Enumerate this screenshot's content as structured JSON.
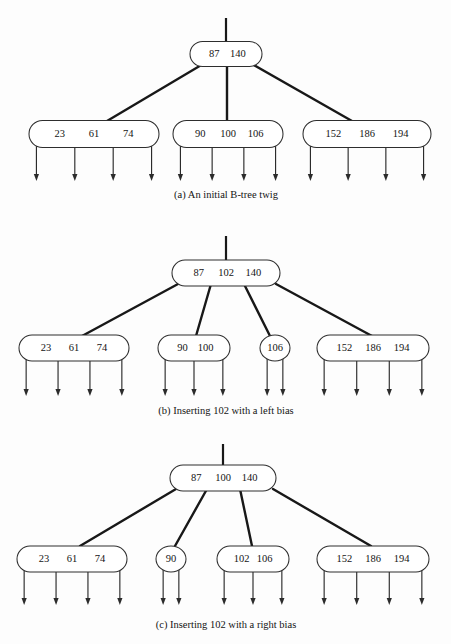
{
  "figure": {
    "width": 451,
    "height": 644,
    "background_color": "#fdfdfd",
    "line_color": "#181818",
    "node_fill": "#ffffff",
    "node_stroke": "#2e2e2e",
    "text_color": "#141414"
  },
  "chart_data": {
    "type": "diagram",
    "panels": [
      {
        "id": "a",
        "caption": "(a)  An initial B-tree twig",
        "caption_x": 226,
        "caption_y": 196,
        "root_stem": {
          "x": 226,
          "y1": 18,
          "y2": 44
        },
        "root": {
          "label": "root-node-a",
          "keys": [
            "87",
            "140"
          ],
          "cx": 226,
          "cy": 54,
          "w": 72,
          "h": 25,
          "shape": "stadium"
        },
        "children": [
          {
            "label": "leaf-23-61-74",
            "keys": [
              "23",
              "61",
              "74"
            ],
            "cx": 94,
            "cy": 134,
            "w": 130,
            "h": 27,
            "shape": "stadium",
            "pointers": 4,
            "pointer_end_y": 181,
            "link_from_x": 203,
            "link_from_y": 64,
            "link_to_x": 107,
            "link_to_y": 121
          },
          {
            "label": "leaf-90-100-106",
            "keys": [
              "90",
              "100",
              "106"
            ],
            "cx": 228,
            "cy": 134,
            "w": 110,
            "h": 27,
            "shape": "stadium",
            "pointers": 4,
            "pointer_end_y": 181,
            "link_from_x": 227,
            "link_from_y": 64,
            "link_to_x": 227,
            "link_to_y": 121
          },
          {
            "label": "leaf-152-186-194",
            "keys": [
              "152",
              "186",
              "194"
            ],
            "cx": 367,
            "cy": 134,
            "w": 128,
            "h": 27,
            "shape": "stadium",
            "pointers": 4,
            "pointer_end_y": 181,
            "link_from_x": 252,
            "link_from_y": 64,
            "link_to_x": 352,
            "link_to_y": 121
          }
        ]
      },
      {
        "id": "b",
        "caption": "(b)  Inserting 102 with a left bias",
        "caption_x": 226,
        "caption_y": 412,
        "root_stem": {
          "x": 226,
          "y1": 236,
          "y2": 262
        },
        "root": {
          "label": "root-node-b",
          "keys": [
            "87",
            "102",
            "140"
          ],
          "cx": 226,
          "cy": 273,
          "w": 108,
          "h": 26,
          "shape": "stadium"
        },
        "children": [
          {
            "label": "leaf-23-61-74",
            "keys": [
              "23",
              "61",
              "74"
            ],
            "cx": 74,
            "cy": 348,
            "w": 110,
            "h": 26,
            "shape": "stadium",
            "pointers": 4,
            "pointer_end_y": 396,
            "link_from_x": 178,
            "link_from_y": 284,
            "link_to_x": 82,
            "link_to_y": 336
          },
          {
            "label": "leaf-90-100",
            "keys": [
              "90",
              "100"
            ],
            "cx": 194,
            "cy": 348,
            "w": 72,
            "h": 26,
            "shape": "stadium",
            "pointers": 3,
            "pointer_end_y": 396,
            "link_from_x": 211,
            "link_from_y": 284,
            "link_to_x": 196,
            "link_to_y": 336
          },
          {
            "label": "leaf-106",
            "keys": [
              "106"
            ],
            "cx": 275,
            "cy": 348,
            "w": 30,
            "h": 26,
            "shape": "circle",
            "pointers": 2,
            "pointer_end_y": 396,
            "link_from_x": 244,
            "link_from_y": 284,
            "link_to_x": 270,
            "link_to_y": 336
          },
          {
            "label": "leaf-152-186-194",
            "keys": [
              "152",
              "186",
              "194"
            ],
            "cx": 373,
            "cy": 348,
            "w": 112,
            "h": 26,
            "shape": "stadium",
            "pointers": 4,
            "pointer_end_y": 396,
            "link_from_x": 276,
            "link_from_y": 284,
            "link_to_x": 372,
            "link_to_y": 336
          }
        ]
      },
      {
        "id": "c",
        "caption": "(c)  Inserting 102 with a right bias",
        "caption_x": 226,
        "caption_y": 626,
        "root_stem": {
          "x": 223,
          "y1": 444,
          "y2": 466
        },
        "root": {
          "label": "root-node-c",
          "keys": [
            "87",
            "100",
            "140"
          ],
          "cx": 223,
          "cy": 478,
          "w": 106,
          "h": 26,
          "shape": "stadium"
        },
        "children": [
          {
            "label": "leaf-23-61-74",
            "keys": [
              "23",
              "61",
              "74"
            ],
            "cx": 72,
            "cy": 559,
            "w": 110,
            "h": 26,
            "shape": "stadium",
            "pointers": 4,
            "pointer_end_y": 605,
            "link_from_x": 176,
            "link_from_y": 489,
            "link_to_x": 80,
            "link_to_y": 546
          },
          {
            "label": "leaf-90",
            "keys": [
              "90"
            ],
            "cx": 171,
            "cy": 559,
            "w": 30,
            "h": 26,
            "shape": "circle",
            "pointers": 2,
            "pointer_end_y": 605,
            "link_from_x": 207,
            "link_from_y": 489,
            "link_to_x": 175,
            "link_to_y": 546
          },
          {
            "label": "leaf-102-106",
            "keys": [
              "102",
              "106"
            ],
            "cx": 253,
            "cy": 559,
            "w": 72,
            "h": 26,
            "shape": "stadium",
            "pointers": 3,
            "pointer_end_y": 605,
            "link_from_x": 240,
            "link_from_y": 489,
            "link_to_x": 252,
            "link_to_y": 546
          },
          {
            "label": "leaf-152-186-194",
            "keys": [
              "152",
              "186",
              "194"
            ],
            "cx": 373,
            "cy": 559,
            "w": 112,
            "h": 26,
            "shape": "stadium",
            "pointers": 4,
            "pointer_end_y": 605,
            "link_from_x": 273,
            "link_from_y": 489,
            "link_to_x": 371,
            "link_to_y": 546
          }
        ]
      }
    ]
  }
}
